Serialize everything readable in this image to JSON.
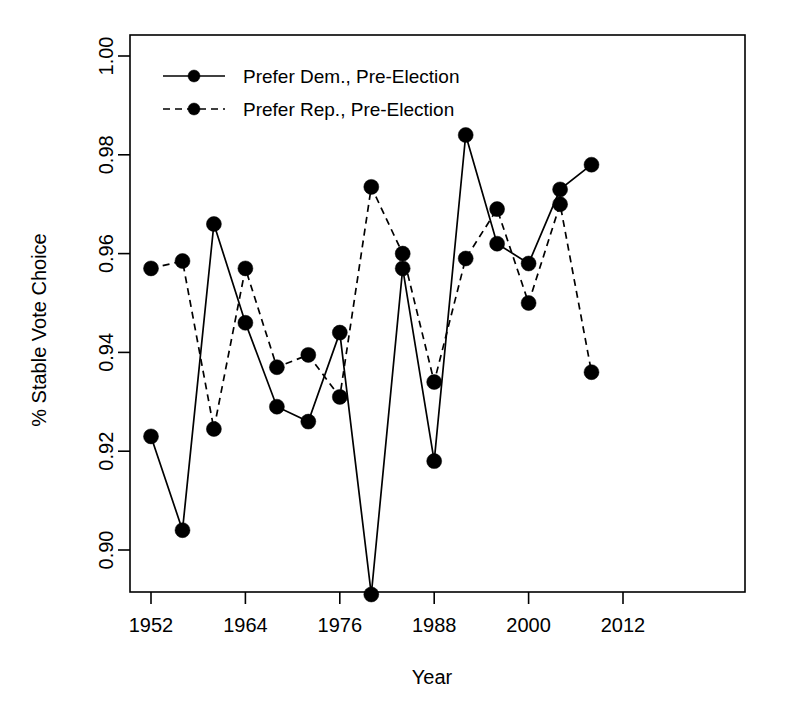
{
  "chart_data": {
    "type": "line",
    "title": "",
    "xlabel": "Year",
    "ylabel": "% Stable Vote Choice",
    "xlim": [
      1948,
      2014
    ],
    "ylim": [
      0.886,
      1.004
    ],
    "grid": false,
    "legend_position": "top-left",
    "xticks": [
      1952,
      1964,
      1976,
      1988,
      2000,
      2012
    ],
    "xtick_labels": [
      "1952",
      "1964",
      "1976",
      "1988",
      "2000",
      "2012"
    ],
    "yticks": [
      0.9,
      0.92,
      0.94,
      0.96,
      0.98,
      1.0
    ],
    "ytick_labels": [
      "0.90",
      "0.92",
      "0.94",
      "0.96",
      "0.98",
      "1.00"
    ],
    "series": [
      {
        "name": "Prefer Dem., Pre-Election",
        "linestyle": "solid",
        "marker": "filled-circle",
        "color": "#000000",
        "x": [
          1952,
          1956,
          1960,
          1964,
          1968,
          1972,
          1976,
          1980,
          1984,
          1988,
          1992,
          1996,
          2000,
          2004,
          2008
        ],
        "values": [
          0.923,
          0.904,
          0.966,
          0.946,
          0.929,
          0.926,
          0.944,
          0.891,
          0.957,
          0.918,
          0.984,
          0.962,
          0.958,
          0.973,
          0.978
        ]
      },
      {
        "name": "Prefer Rep., Pre-Election",
        "linestyle": "dashed",
        "marker": "filled-circle",
        "color": "#000000",
        "x": [
          1952,
          1956,
          1960,
          1964,
          1968,
          1972,
          1976,
          1980,
          1984,
          1988,
          1992,
          1996,
          2000,
          2004,
          2008
        ],
        "values": [
          0.957,
          0.9585,
          0.9245,
          0.957,
          0.937,
          0.9395,
          0.931,
          0.9735,
          0.96,
          0.934,
          0.959,
          0.969,
          0.95,
          0.97,
          0.936
        ]
      }
    ]
  },
  "legend": {
    "entries": [
      {
        "label": "Prefer Dem., Pre-Election",
        "style": "solid"
      },
      {
        "label": "Prefer Rep., Pre-Election",
        "style": "dashed"
      }
    ]
  },
  "axes": {
    "x_title": "Year",
    "y_title": "% Stable Vote Choice"
  }
}
